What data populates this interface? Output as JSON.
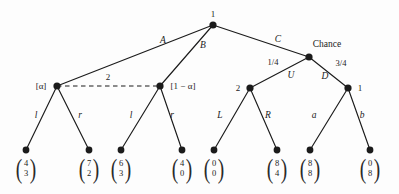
{
  "figure": {
    "type": "extensive-form-game-tree",
    "background_color": "#fdfdfd",
    "ink_color": "#1b1b1b",
    "width": 399,
    "height": 194
  },
  "nodes": {
    "root": {
      "label": "1",
      "x": 213,
      "y": 25,
      "label_x": 213,
      "label_y": 14
    },
    "alpha_left": {
      "label": "[α]",
      "x": 57,
      "y": 86,
      "label_x": 41,
      "label_y": 86
    },
    "alpha_right": {
      "label": "[1 − α]",
      "x": 160,
      "y": 86,
      "label_x": 183,
      "label_y": 86
    },
    "chance": {
      "label": "Chance",
      "x": 309,
      "y": 57,
      "label_x": 327,
      "label_y": 45
    },
    "player2_mid": {
      "label": "2",
      "x": 250,
      "y": 88,
      "label_x": 238,
      "label_y": 88
    },
    "player1_right": {
      "label": "1",
      "x": 348,
      "y": 88,
      "label_x": 360,
      "label_y": 88
    }
  },
  "information_set": {
    "label": "2",
    "label_x": 108,
    "label_y": 77,
    "from_x": 57,
    "to_x": 160,
    "y": 86,
    "style": "dashed"
  },
  "edges": [
    {
      "label": "A",
      "from": "root",
      "to": "alpha_left",
      "label_x": 163,
      "label_y": 41,
      "style": "italic"
    },
    {
      "label": "B",
      "from": "root",
      "to": "alpha_right",
      "label_x": 203,
      "label_y": 46,
      "style": "italic"
    },
    {
      "label": "C",
      "from": "root",
      "to": "chance",
      "label_x": 278,
      "label_y": 40,
      "style": "italic"
    },
    {
      "label": "1/4",
      "from": "chance",
      "to": "player2_mid",
      "label_x": 273,
      "label_y": 62,
      "style": "upright"
    },
    {
      "label": "U",
      "from": "chance",
      "to": "player2_mid",
      "label_x": 291,
      "label_y": 76,
      "style": "italic"
    },
    {
      "label": "3/4",
      "from": "chance",
      "to": "player1_right",
      "label_x": 341,
      "label_y": 63,
      "style": "upright"
    },
    {
      "label": "D",
      "from": "chance",
      "to": "player1_right",
      "label_x": 325,
      "label_y": 77,
      "style": "italic"
    },
    {
      "label": "l",
      "from": "alpha_left",
      "to": "t1",
      "label_x": 36,
      "label_y": 116,
      "style": "italic"
    },
    {
      "label": "r",
      "from": "alpha_left",
      "to": "t2",
      "label_x": 80,
      "label_y": 116,
      "style": "italic"
    },
    {
      "label": "l",
      "from": "alpha_right",
      "to": "t3",
      "label_x": 131,
      "label_y": 116,
      "style": "italic"
    },
    {
      "label": "r",
      "from": "alpha_right",
      "to": "t4",
      "label_x": 172,
      "label_y": 116,
      "style": "italic"
    },
    {
      "label": "L",
      "from": "player2_mid",
      "to": "t5",
      "label_x": 220,
      "label_y": 116,
      "style": "italic"
    },
    {
      "label": "R",
      "from": "player2_mid",
      "to": "t6",
      "label_x": 268,
      "label_y": 116,
      "style": "italic"
    },
    {
      "label": "a",
      "from": "player1_right",
      "to": "t7",
      "label_x": 314,
      "label_y": 116,
      "style": "italic"
    },
    {
      "label": "b",
      "from": "player1_right",
      "to": "t8",
      "label_x": 362,
      "label_y": 116,
      "style": "italic"
    }
  ],
  "terminals": [
    {
      "id": "t1",
      "x": 26,
      "y": 150,
      "payoff_top": "4",
      "payoff_bottom": "3"
    },
    {
      "id": "t2",
      "x": 89,
      "y": 150,
      "payoff_top": "7",
      "payoff_bottom": "2"
    },
    {
      "id": "t3",
      "x": 121,
      "y": 150,
      "payoff_top": "6",
      "payoff_bottom": "3"
    },
    {
      "id": "t4",
      "x": 182,
      "y": 150,
      "payoff_top": "4",
      "payoff_bottom": "0"
    },
    {
      "id": "t5",
      "x": 214,
      "y": 150,
      "payoff_top": "0",
      "payoff_bottom": "0"
    },
    {
      "id": "t6",
      "x": 277,
      "y": 150,
      "payoff_top": "8",
      "payoff_bottom": "4"
    },
    {
      "id": "t7",
      "x": 310,
      "y": 150,
      "payoff_top": "8",
      "payoff_bottom": "8"
    },
    {
      "id": "t8",
      "x": 370,
      "y": 150,
      "payoff_top": "0",
      "payoff_bottom": "8"
    }
  ],
  "payoff_parens": {
    "left": "(",
    "right": ")"
  }
}
